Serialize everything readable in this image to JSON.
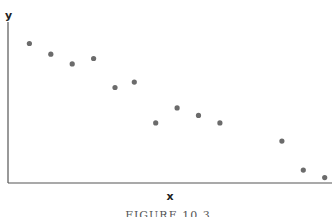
{
  "figure": {
    "caption": "FIGURE 10.3"
  },
  "chart_data": {
    "type": "scatter",
    "title": "",
    "xlabel": "x",
    "ylabel": "y",
    "grid": false,
    "legend": null,
    "xlim": [
      0,
      15
    ],
    "ylim": [
      0,
      15
    ],
    "tick_labels": {
      "x": [],
      "y": []
    },
    "point_color": "#6b6b6b",
    "axis_color": "#555555",
    "points": [
      {
        "x": 1.0,
        "y": 13.0
      },
      {
        "x": 2.0,
        "y": 12.0
      },
      {
        "x": 3.0,
        "y": 11.1
      },
      {
        "x": 4.0,
        "y": 11.6
      },
      {
        "x": 5.0,
        "y": 8.9
      },
      {
        "x": 5.9,
        "y": 9.4
      },
      {
        "x": 6.9,
        "y": 5.6
      },
      {
        "x": 7.9,
        "y": 7.0
      },
      {
        "x": 8.9,
        "y": 6.3
      },
      {
        "x": 9.9,
        "y": 5.6
      },
      {
        "x": 12.8,
        "y": 3.9
      },
      {
        "x": 13.8,
        "y": 1.2
      },
      {
        "x": 14.8,
        "y": 0.5
      }
    ]
  }
}
